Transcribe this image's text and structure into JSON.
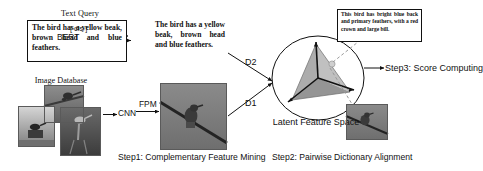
{
  "figure": {
    "colors": {
      "line": "#111111",
      "box_border": "#111111",
      "dashed": "#9a9a9a",
      "facet_light": "#b9b9b9",
      "facet_mid": "#9d9d9d",
      "facet_dark": "#808080"
    }
  },
  "text_query": {
    "title": "Text Query",
    "content": "The bird has a yellow beak, brown head and blue feathers."
  },
  "encoder": {
    "model_label": "BERT",
    "token_label": "[ cls ]"
  },
  "encoded_text": {
    "content": "The bird has a yellow beak, brown head and blue feathers."
  },
  "image_database": {
    "title": "Image Database",
    "items": [
      {
        "name": "bird-on-branch-thumbnail",
        "alt": "bird perched on a branch"
      },
      {
        "name": "bird-on-stump-thumbnail",
        "alt": "bird standing on a stump in fog"
      },
      {
        "name": "bird-on-post-thumbnail",
        "alt": "bird perched on a wooden post"
      }
    ]
  },
  "visual_encoder": {
    "cnn_label": "CNN",
    "fpm_label": "FPM"
  },
  "feature_image": {
    "name": "bird-on-wire-image",
    "alt": "bird sitting on a diagonal wire against grey sky"
  },
  "dictionaries": {
    "d2_label": "D2",
    "d1_label": "D1"
  },
  "latent_space": {
    "label": "Latent Feature Space"
  },
  "retrieved": {
    "text": "This bird has bright blue back and primary feathers, with a red crown and large bill.",
    "image_alt": "bird sitting on a wire"
  },
  "steps": {
    "step1": "Step1: Complementary Feature Mining",
    "step2": "Step2: Pairwise Dictionary Alignment",
    "step3": "Step3: Score Computing"
  }
}
